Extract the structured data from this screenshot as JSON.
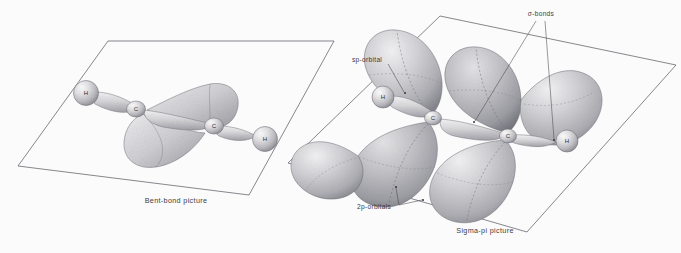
{
  "figure": {
    "kind": "molecular-orbital-illustration",
    "molecule": "acetylene",
    "background_color": "#fbfbfc",
    "ink_color": "#3b3b3f",
    "orbital_fill": "#b9b9bd"
  },
  "panels": [
    {
      "id": "bent-bond",
      "caption": "Bent-bond picture",
      "atoms": [
        {
          "symbol": "H",
          "x": 86,
          "y": 93
        },
        {
          "symbol": "C",
          "x": 136,
          "y": 108
        },
        {
          "symbol": "C",
          "x": 214,
          "y": 125
        },
        {
          "symbol": "H",
          "x": 264,
          "y": 139
        }
      ],
      "annotations": []
    },
    {
      "id": "sigma-pi",
      "caption": "Sigma-pi picture",
      "atoms": [
        {
          "symbol": "H",
          "x": 383,
          "y": 96
        },
        {
          "symbol": "C",
          "x": 433,
          "y": 117
        },
        {
          "symbol": "C",
          "x": 507,
          "y": 136
        },
        {
          "symbol": "H",
          "x": 566,
          "y": 140
        }
      ],
      "annotations": [
        {
          "id": "sp-orbital",
          "text": "sp-orbital"
        },
        {
          "id": "sigma-bonds",
          "text": "σ-bonds"
        },
        {
          "id": "2p-orbitals",
          "text": "2p-orbitals"
        }
      ]
    }
  ]
}
